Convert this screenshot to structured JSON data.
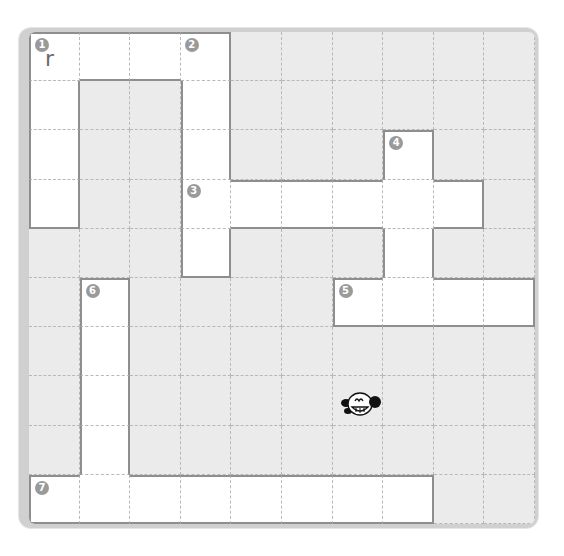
{
  "puzzle": {
    "title": "crossword-grid",
    "rows": 10,
    "cols": 10,
    "colors": {
      "frame": "#d0d0d0",
      "blocked": "#ebebeb",
      "open": "#ffffff",
      "clue_badge": "#9a9a9a",
      "border": "#8e8e8e"
    },
    "entries": [
      {
        "number": "1",
        "direction": "across",
        "row": 0,
        "col": 0,
        "length": 4
      },
      {
        "number": "1",
        "direction": "down",
        "row": 0,
        "col": 0,
        "length": 4
      },
      {
        "number": "2",
        "direction": "down",
        "row": 0,
        "col": 3,
        "length": 5
      },
      {
        "number": "3",
        "direction": "across",
        "row": 3,
        "col": 3,
        "length": 6
      },
      {
        "number": "4",
        "direction": "down",
        "row": 2,
        "col": 7,
        "length": 4
      },
      {
        "number": "5",
        "direction": "across",
        "row": 5,
        "col": 6,
        "length": 4
      },
      {
        "number": "6",
        "direction": "down",
        "row": 5,
        "col": 1,
        "length": 5
      },
      {
        "number": "7",
        "direction": "across",
        "row": 9,
        "col": 0,
        "length": 8
      }
    ],
    "filled_letters": [
      {
        "row": 0,
        "col": 1,
        "value": "r",
        "row_idx": 1,
        "col_idx": 0
      }
    ],
    "letter_r0c0": "r",
    "mascot_icon": "smiling-dog-face-icon"
  }
}
